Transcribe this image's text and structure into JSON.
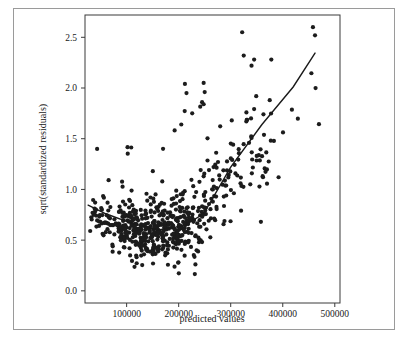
{
  "figure": {
    "background_color": "#ffffff",
    "frame_color": "#9a9a9a",
    "point_color": "#1c1c1c",
    "line_color": "#1a1a1a"
  },
  "chart_data": {
    "type": "scatter",
    "title": "",
    "subtitle": "",
    "xlabel": "predicted values",
    "ylabel": "sqrt(standardized residuals)",
    "xlim": [
      20000,
      510000
    ],
    "ylim": [
      -0.12,
      2.72
    ],
    "xticks": [
      100000,
      200000,
      300000,
      400000,
      500000
    ],
    "xticklabels": [
      "100000",
      "200000",
      "300000",
      "400000",
      "500000"
    ],
    "yticks": [
      0.0,
      0.5,
      1.0,
      1.5,
      2.0,
      2.5
    ],
    "yticklabels": [
      "0.0",
      "0.5",
      "1.0",
      "1.5",
      "2.0",
      "2.5"
    ],
    "grid": false,
    "legend": null,
    "legend_position": "none",
    "annotations": [],
    "marker": {
      "shape": "circle",
      "size_px": 4.2,
      "color": "#1c1c1c"
    },
    "trend_line": {
      "name": "lowess / regression fit",
      "style": "solid",
      "color": "#1a1a1a",
      "points": [
        {
          "x": 26000,
          "y": 0.845
        },
        {
          "x": 60000,
          "y": 0.76
        },
        {
          "x": 110000,
          "y": 0.665
        },
        {
          "x": 160000,
          "y": 0.6
        },
        {
          "x": 210000,
          "y": 0.64
        },
        {
          "x": 248000,
          "y": 0.76
        },
        {
          "x": 300000,
          "y": 1.22
        },
        {
          "x": 360000,
          "y": 1.64
        },
        {
          "x": 420000,
          "y": 2.01
        },
        {
          "x": 462000,
          "y": 2.345
        }
      ]
    },
    "series": [
      {
        "name": "observations",
        "n_points": 612,
        "x": [
          38000,
          45000,
          48000,
          52000,
          55000,
          58000,
          60000,
          61000,
          63000,
          65000,
          66000,
          68000,
          70000,
          71000,
          72000,
          73000,
          74000,
          75000,
          76000,
          77000,
          78000,
          79000,
          80000,
          81000,
          82000,
          83000,
          84000,
          85000,
          86000,
          87000,
          88000,
          89000,
          90000,
          91000,
          92000,
          93000,
          94000,
          95000,
          96000,
          97000,
          98000,
          99000,
          100000,
          101000,
          102000,
          103000,
          104000,
          105000,
          106000,
          107000,
          108000,
          109000,
          110000,
          111000,
          112000,
          113000,
          114000,
          115000,
          116000,
          117000,
          118000,
          119000,
          120000,
          121000,
          122000,
          123000,
          124000,
          125000,
          126000,
          127000,
          128000,
          129000,
          130000,
          131000,
          132000,
          133000,
          134000,
          135000,
          136000,
          137000,
          138000,
          139000,
          140000,
          141000,
          142000,
          143000,
          144000,
          145000,
          146000,
          147000,
          148000,
          149000,
          150000,
          151000,
          152000,
          153000,
          154000,
          155000,
          156000,
          157000,
          158000,
          159000,
          160000,
          161000,
          162000,
          163000,
          164000,
          165000,
          166000,
          167000,
          168000,
          169000,
          170000,
          171000,
          172000,
          173000,
          174000,
          175000,
          176000,
          177000,
          178000,
          179000,
          180000,
          181000,
          182000,
          183000,
          184000,
          185000,
          186000,
          187000,
          188000,
          189000,
          190000,
          191000,
          192000,
          193000,
          194000,
          195000,
          196000,
          197000,
          198000,
          199000,
          200000,
          201000,
          202000,
          203000,
          204000,
          205000,
          206000,
          207000,
          208000,
          209000,
          210000,
          211000,
          212000,
          213000,
          214000,
          215000,
          216000,
          217000,
          218000,
          219000,
          220000,
          221000,
          222000,
          223000,
          224000,
          225000,
          226000,
          227000,
          228000,
          229000,
          230000,
          231000,
          232000,
          233000,
          234000,
          235000,
          236000,
          237000,
          238000,
          239000,
          240000,
          241000,
          242000,
          243000,
          244000,
          245000,
          246000,
          247000,
          248000,
          249000,
          250000,
          251000,
          252000,
          253000,
          254000,
          255000,
          256000,
          257000,
          258000,
          259000,
          260000,
          262000,
          264000,
          266000,
          268000,
          270000,
          272000,
          274000,
          276000,
          278000,
          280000,
          282000,
          284000,
          286000,
          288000,
          290000,
          292000,
          294000,
          296000,
          298000,
          300000,
          302000,
          305000,
          308000,
          311000,
          314000,
          317000,
          320000,
          323000,
          326000,
          330000,
          334000,
          338000,
          342000,
          346000,
          350000,
          356000,
          362000,
          368000,
          375000,
          382000,
          390000,
          398000,
          410000,
          425000,
          440000,
          455000,
          458000,
          462000
        ],
        "y_range_note": "y values span 0.0 to 2.6; dense cluster between 0.1 and 0.9 for x in 80000-250000"
      }
    ]
  },
  "axes": {
    "x_tick_positions_px": [
      124.0,
      177.5,
      231.0,
      284.5,
      338.0
    ],
    "y_tick_positions_px": [
      295.0,
      244.0,
      193.0,
      142.0,
      91.0,
      40.0
    ],
    "plot_left_px": 85,
    "plot_right_px": 340,
    "plot_top_px": 15,
    "plot_bottom_px": 303
  }
}
